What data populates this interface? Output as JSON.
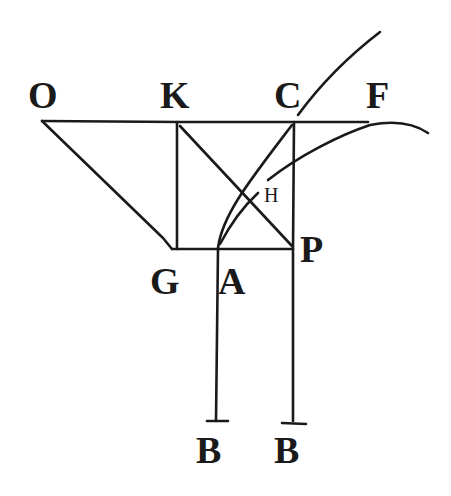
{
  "diagram": {
    "type": "geometric-figure",
    "style": {
      "ink_color": "#1a1a1a",
      "background": "#ffffff"
    },
    "labels": {
      "O": "O",
      "K": "K",
      "C": "C",
      "F": "F",
      "H": "H",
      "G": "G",
      "A": "A",
      "P": "P",
      "B_left": "B",
      "B_right": "B"
    },
    "points": {
      "O": [
        42,
        121
      ],
      "K": [
        177,
        122
      ],
      "C": [
        294,
        122
      ],
      "G": [
        172,
        249
      ],
      "A": [
        218,
        249
      ],
      "P": [
        293,
        249
      ],
      "H": [
        268,
        180
      ],
      "B_left": [
        216,
        421
      ],
      "B_right": [
        293,
        421
      ]
    },
    "segments": [
      {
        "name": "OC-line",
        "from": "O",
        "to": [
          395,
          122
        ]
      },
      {
        "name": "OG-line",
        "from": "O",
        "to": "G"
      },
      {
        "name": "KG-vertical",
        "from": "K",
        "to": [
          177,
          249
        ]
      },
      {
        "name": "GP-line",
        "from": "G",
        "to": "P"
      },
      {
        "name": "KP-diagonal",
        "from": "K",
        "to": "P"
      },
      {
        "name": "CP-vertical",
        "from": "C",
        "to": "P"
      },
      {
        "name": "AB-vertical",
        "from": "A",
        "to": "B_left"
      },
      {
        "name": "PB-vertical",
        "from": "P",
        "to": "B_right"
      },
      {
        "name": "AH-line",
        "from": "A",
        "to": [
          258,
          193
        ]
      }
    ],
    "curves": [
      {
        "name": "curve-A-to-C-upper",
        "description": "curve from A through C rising to top-right"
      },
      {
        "name": "curve-H-to-F",
        "description": "curve from H sweeping up through F and descending to the right"
      }
    ]
  }
}
